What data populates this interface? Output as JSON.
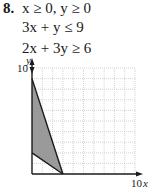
{
  "problem": {
    "number": "8.",
    "constraints": [
      "x ≥ 0, y ≥ 0",
      "3x + y ≤ 9",
      "2x + 3y ≥ 6"
    ]
  },
  "chart_data": {
    "type": "area",
    "title": "",
    "xlabel": "x",
    "ylabel": "y",
    "xlim": [
      0,
      10
    ],
    "ylim": [
      0,
      10
    ],
    "x_tick_labels": [
      "10"
    ],
    "y_tick_labels": [
      "10"
    ],
    "grid": true,
    "grid_step": 1,
    "lines": [
      {
        "name": "3x + y = 9",
        "points": [
          [
            0,
            9
          ],
          [
            3,
            0
          ]
        ]
      },
      {
        "name": "2x + 3y = 6",
        "points": [
          [
            0,
            2
          ],
          [
            3,
            0
          ]
        ]
      }
    ],
    "feasible_region": {
      "vertices": [
        [
          0,
          2
        ],
        [
          0,
          9
        ],
        [
          3,
          0
        ]
      ],
      "fill_color": "#9a9a9a"
    },
    "colors": {
      "axis": "#1a1a1a",
      "grid": "#c8c8c8",
      "fill": "#9a9a9a"
    }
  }
}
